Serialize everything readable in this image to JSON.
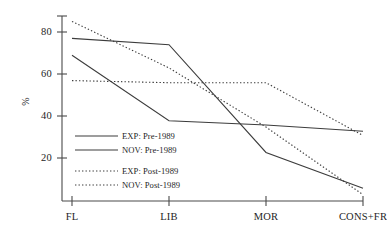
{
  "chart_data": {
    "type": "line",
    "title": "",
    "xlabel": "",
    "ylabel": "%",
    "categories": [
      "FL",
      "LIB",
      "MOR",
      "CONS+FR"
    ],
    "ylim": [
      0,
      88
    ],
    "yticks": [
      20,
      40,
      60,
      80
    ],
    "grid": false,
    "legend_position": "inside-left",
    "series": [
      {
        "name": "EXP: Pre-1989",
        "style": "solid",
        "color": "#3c3c3c",
        "values": [
          77,
          74,
          23,
          6
        ]
      },
      {
        "name": "NOV: Pre-1989",
        "style": "solid",
        "color": "#3c3c3c",
        "values": [
          69,
          38,
          36,
          33
        ]
      },
      {
        "name": "EXP: Post-1989",
        "style": "dotted",
        "color": "#3c3c3c",
        "values": [
          85,
          63,
          35,
          3
        ]
      },
      {
        "name": "NOV: Post-1989",
        "style": "dotted",
        "color": "#3c3c3c",
        "values": [
          57,
          56,
          56,
          31
        ]
      }
    ]
  },
  "axis": {
    "y_label": "%",
    "y_tick_labels": [
      "80",
      "60",
      "40",
      "20"
    ],
    "x_tick_labels": [
      "FL",
      "LIB",
      "MOR",
      "CONS+FR"
    ]
  },
  "legend": {
    "items": [
      {
        "label": "EXP: Pre-1989"
      },
      {
        "label": "NOV: Pre-1989"
      },
      {
        "label": "EXP: Post-1989"
      },
      {
        "label": "NOV: Post-1989"
      }
    ]
  }
}
